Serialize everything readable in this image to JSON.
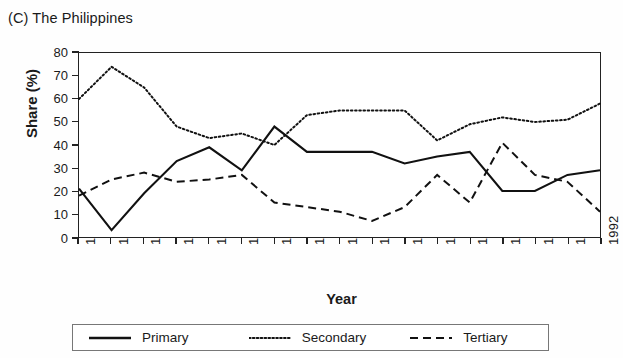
{
  "figure": {
    "clipped_header_text": "",
    "panel_label": "(C) The Philippines",
    "xlabel": "Year",
    "ylabel": "Share (%)"
  },
  "legend": {
    "items": [
      {
        "label": "Primary",
        "style": "solid",
        "icon": "solid-line-icon"
      },
      {
        "label": "Secondary",
        "style": "dotted",
        "icon": "dotted-line-icon"
      },
      {
        "label": "Tertiary",
        "style": "dashed",
        "icon": "dashed-line-icon"
      }
    ]
  },
  "axes": {
    "y_ticks": [
      "80",
      "70",
      "60",
      "50",
      "40",
      "30",
      "20",
      "10",
      "0"
    ],
    "x_ticks": [
      "1976",
      "1977",
      "1978",
      "1979",
      "1980",
      "1981",
      "1982",
      "1983",
      "1984",
      "1985",
      "1986",
      "1987",
      "1988",
      "1989",
      "1990",
      "1991",
      "1992"
    ]
  },
  "chart_data": {
    "type": "line",
    "title": "(C) The Philippines",
    "xlabel": "Year",
    "ylabel": "Share (%)",
    "xlim": [
      1976,
      1992
    ],
    "ylim": [
      0,
      80
    ],
    "ytick_step": 10,
    "grid": false,
    "legend_position": "bottom",
    "x": [
      1976,
      1977,
      1978,
      1979,
      1980,
      1981,
      1982,
      1983,
      1984,
      1985,
      1986,
      1987,
      1988,
      1989,
      1990,
      1991,
      1992
    ],
    "series": [
      {
        "name": "Primary",
        "style": "solid",
        "color": "#111111",
        "values": [
          21,
          3,
          19,
          33,
          39,
          29,
          48,
          37,
          37,
          37,
          32,
          35,
          37,
          20,
          20,
          27,
          29
        ]
      },
      {
        "name": "Secondary",
        "style": "dotted",
        "color": "#111111",
        "values": [
          60,
          74,
          65,
          48,
          43,
          45,
          40,
          53,
          55,
          55,
          55,
          42,
          49,
          52,
          50,
          51,
          58
        ]
      },
      {
        "name": "Tertiary",
        "style": "dashed",
        "color": "#111111",
        "values": [
          18,
          25,
          28,
          24,
          25,
          27,
          15,
          13,
          11,
          7,
          13,
          27,
          15,
          41,
          27,
          24,
          11
        ]
      }
    ]
  }
}
